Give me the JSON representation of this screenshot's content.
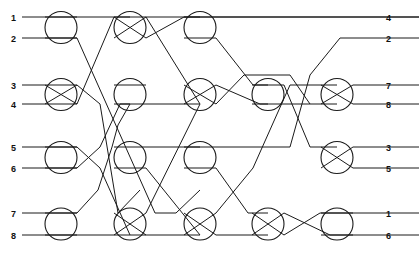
{
  "figure": {
    "type": "switching-network-diagram",
    "width": 419,
    "height": 254,
    "background_color": "#ffffff",
    "line_color": "#1a1a1a"
  },
  "geometry": {
    "rows_y": [
      17,
      38,
      85,
      104,
      147,
      168,
      213,
      235
    ],
    "columns_x": [
      61,
      130,
      200,
      268,
      337
    ],
    "node_radius": 16,
    "left_stub_x": 22,
    "right_stub_x": 378
  },
  "labels": {
    "left": [
      "1",
      "2",
      "3",
      "4",
      "5",
      "6",
      "7",
      "8"
    ],
    "right": [
      "4",
      "2",
      "7",
      "8",
      "3",
      "5",
      "1",
      "6"
    ]
  },
  "left_label_x": 16,
  "right_label_x": 386,
  "nodes": [
    {
      "name": "node-c1-r12",
      "col": 0,
      "rows": [
        0,
        1
      ],
      "crossed": false
    },
    {
      "name": "node-c1-r34",
      "col": 0,
      "rows": [
        2,
        3
      ],
      "crossed": true
    },
    {
      "name": "node-c1-r56",
      "col": 0,
      "rows": [
        4,
        5
      ],
      "crossed": false
    },
    {
      "name": "node-c1-r78",
      "col": 0,
      "rows": [
        6,
        7
      ],
      "crossed": false
    },
    {
      "name": "node-c2-r12",
      "col": 1,
      "rows": [
        0,
        1
      ],
      "crossed": true
    },
    {
      "name": "node-c2-r34",
      "col": 1,
      "rows": [
        2,
        3
      ],
      "crossed": false
    },
    {
      "name": "node-c2-r56",
      "col": 1,
      "rows": [
        4,
        5
      ],
      "crossed": false
    },
    {
      "name": "node-c2-r78",
      "col": 1,
      "rows": [
        6,
        7
      ],
      "crossed": true
    },
    {
      "name": "node-c3-r12",
      "col": 2,
      "rows": [
        0,
        1
      ],
      "crossed": false
    },
    {
      "name": "node-c3-r34",
      "col": 2,
      "rows": [
        2,
        3
      ],
      "crossed": true
    },
    {
      "name": "node-c3-r56",
      "col": 2,
      "rows": [
        4,
        5
      ],
      "crossed": false
    },
    {
      "name": "node-c3-r78",
      "col": 2,
      "rows": [
        6,
        7
      ],
      "crossed": true
    },
    {
      "name": "node-c4-r34",
      "col": 3,
      "rows": [
        2,
        3
      ],
      "crossed": false
    },
    {
      "name": "node-c4-r78",
      "col": 3,
      "rows": [
        6,
        7
      ],
      "crossed": true
    },
    {
      "name": "node-c5-r34",
      "col": 4,
      "rows": [
        2,
        3
      ],
      "crossed": true
    },
    {
      "name": "node-c5-r56",
      "col": 4,
      "rows": [
        4,
        5
      ],
      "crossed": true
    },
    {
      "name": "node-c5-r78",
      "col": 4,
      "rows": [
        6,
        7
      ],
      "crossed": false
    }
  ],
  "wire_paths": [
    "M22,17 L419,17",
    "M22,38 L45,38 L77,38",
    "M22,85 L45,85 L77,85",
    "M22,104 L45,104 L77,104",
    "M22,147 L45,147 L77,147",
    "M22,168 L45,168 L77,168",
    "M22,213 L45,213 L77,213",
    "M22,235 L45,235 L77,235",
    "M77,38 L155,213 L176,213 L200,190",
    "M77,85 L100,104 L118,213 L140,190",
    "M77,104 L114,17 L130,17",
    "M77,147 L100,168 L130,235",
    "M77,168 L100,147 L120,104 L130,104",
    "M77,213 L98,190 L112,147 L118,125 L130,104",
    "M77,235 L114,235 L146,235",
    "M146,17 L200,104",
    "M146,38 L184,17 L200,17",
    "M146,104 L184,104 L184,104 L200,104",
    "M146,147 L184,147 L200,147",
    "M146,168 L200,235",
    "M146,213 L200,104",
    "M146,235 L184,235 L200,235",
    "M216,17 L253,17 L419,17",
    "M216,38 L253,85 L268,85",
    "M216,85 L260,104 L268,104",
    "M216,104 L244,75 L290,75 L310,104",
    "M216,147 L248,147 L290,147 L310,75 L340,38 L419,38",
    "M216,168 L248,213 L268,213",
    "M216,213 L253,168 L290,85 L321,85 L337,85",
    "M216,235 L268,235",
    "M284,85 L310,147 L337,147",
    "M284,104 L321,104 L337,104",
    "M284,213 L330,235 L353,235",
    "M284,235 L320,213 L353,213",
    "M353,85 L419,85",
    "M353,104 L419,104",
    "M353,147 L419,147",
    "M353,168 L419,168",
    "M353,213 L419,213",
    "M353,235 L419,235"
  ]
}
